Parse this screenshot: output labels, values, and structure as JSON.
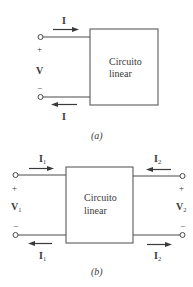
{
  "figure_a": {
    "caption": "(a)",
    "box_label_line1": "Circuito",
    "box_label_line2": "linear",
    "current_top": "I",
    "current_bottom": "I",
    "voltage": "V",
    "plus": "+",
    "minus": "−"
  },
  "figure_b": {
    "caption": "(b)",
    "box_label_line1": "Circuito",
    "box_label_line2": "linear",
    "left": {
      "current_top": "I",
      "current_top_sub": "1",
      "current_bottom": "I",
      "current_bottom_sub": "1",
      "voltage": "V",
      "voltage_sub": "1",
      "plus": "+",
      "minus": "−"
    },
    "right": {
      "current_top": "I",
      "current_top_sub": "2",
      "current_bottom": "I",
      "current_bottom_sub": "2",
      "voltage": "V",
      "voltage_sub": "2",
      "plus": "+",
      "minus": "−"
    }
  },
  "colors": {
    "line": "#4a4a4a",
    "text": "#3a3a3a",
    "background": "#ffffff"
  }
}
